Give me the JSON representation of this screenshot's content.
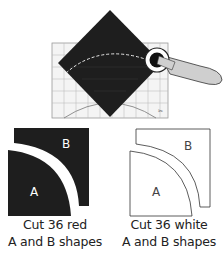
{
  "illustration": {
    "description": "Rotary cutter cutting curve along ruler over dark square fabric",
    "fabric_color": "#1e1e1e",
    "ruler_line_color": "#9a9a9a",
    "dashed_curve_color": "#e8e8e8",
    "cutter_handle_color": "#cfcfcf"
  },
  "pieces": [
    {
      "name": "red",
      "fill": "#1e1e1e",
      "label_a": "A",
      "label_b": "B",
      "caption_line1": "Cut 36 red",
      "caption_line2": "A and B shapes"
    },
    {
      "name": "white",
      "fill": "#ffffff",
      "label_a": "A",
      "label_b": "B",
      "caption_line1": "Cut 36 white",
      "caption_line2": "A and B shapes"
    }
  ]
}
